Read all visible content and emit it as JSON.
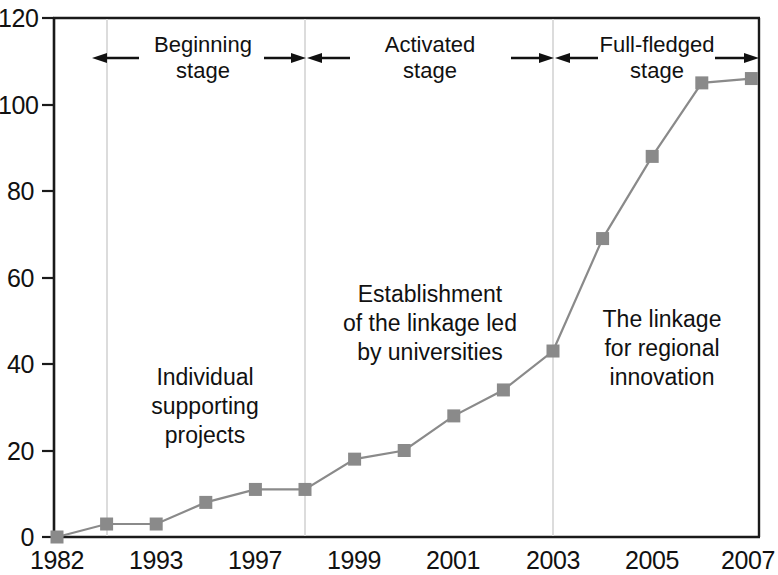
{
  "chart_data": {
    "type": "line",
    "title": "",
    "subtitle": "",
    "xlabel": "",
    "ylabel": "",
    "xlim": [
      0,
      9
    ],
    "ylim": [
      0,
      120
    ],
    "grid": false,
    "legend_position": "none",
    "x_tick_labels": [
      "1982",
      "1993",
      "1997",
      "1999",
      "2001",
      "2003",
      "2005",
      "2007"
    ],
    "y_tick_labels": [
      "0",
      "20",
      "40",
      "60",
      "80",
      "100",
      "120"
    ],
    "y_ticks": [
      0,
      20,
      40,
      60,
      80,
      100,
      120
    ],
    "series": [
      {
        "name": "Number of linkages",
        "color": "#8a8a8a",
        "marker": "square",
        "x": [
          "1982",
          "",
          "1993",
          "",
          "1997",
          "",
          "1999",
          "",
          "2001",
          "",
          "2003",
          "",
          "2005",
          "",
          "2007"
        ],
        "points": [
          {
            "index": 0,
            "x_label": "1982",
            "value": 0
          },
          {
            "index": 1,
            "x_label": "",
            "value": 3
          },
          {
            "index": 2,
            "x_label": "1993",
            "value": 3
          },
          {
            "index": 3,
            "x_label": "",
            "value": 8
          },
          {
            "index": 4,
            "x_label": "1997",
            "value": 11
          },
          {
            "index": 5,
            "x_label": "",
            "value": 11
          },
          {
            "index": 6,
            "x_label": "1999",
            "value": 18
          },
          {
            "index": 7,
            "x_label": "",
            "value": 20
          },
          {
            "index": 8,
            "x_label": "2001",
            "value": 28
          },
          {
            "index": 9,
            "x_label": "",
            "value": 34
          },
          {
            "index": 10,
            "x_label": "2003",
            "value": 43
          },
          {
            "index": 11,
            "x_label": "",
            "value": 69
          },
          {
            "index": 12,
            "x_label": "2005",
            "value": 88
          },
          {
            "index": 13,
            "x_label": "",
            "value": 105
          },
          {
            "index": 14,
            "x_label": "2007",
            "value": 106
          }
        ],
        "values": [
          0,
          3,
          3,
          8,
          11,
          11,
          18,
          20,
          28,
          34,
          43,
          69,
          88,
          105,
          106
        ]
      }
    ],
    "dividers": [
      {
        "name": "divider-1",
        "at_index": 1
      },
      {
        "name": "divider-2",
        "at_index": 5
      },
      {
        "name": "divider-3",
        "at_index": 10
      }
    ],
    "stage_annotations": [
      {
        "id": "beginning",
        "line1": "Beginning",
        "line2": "stage",
        "center_index": 3
      },
      {
        "id": "activated",
        "line1": "Activated",
        "line2": "stage",
        "center_index": 7.6
      },
      {
        "id": "full-fledged",
        "line1": "Full-fledged",
        "line2": "stage",
        "center_index": 12.4
      }
    ],
    "region_annotations": [
      {
        "id": "individual-supporting-projects",
        "lines": [
          "Individual",
          "supporting",
          "projects"
        ],
        "center_index": 3,
        "center_value": 37
      },
      {
        "id": "establishment-linkage-universities",
        "lines": [
          "Establishment",
          "of the linkage led",
          "by universities"
        ],
        "center_index": 7.6,
        "center_value": 59
      },
      {
        "id": "linkage-regional-innovation",
        "lines": [
          "The linkage",
          "for regional",
          "innovation"
        ],
        "center_index": 12.5,
        "center_value": 53
      }
    ],
    "colors": {
      "axis": "#1a1a1a",
      "line": "#8a8a8a",
      "marker": "#8a8a8a",
      "divider": "#d8d8d8",
      "text": "#111111",
      "background": "#ffffff"
    }
  }
}
